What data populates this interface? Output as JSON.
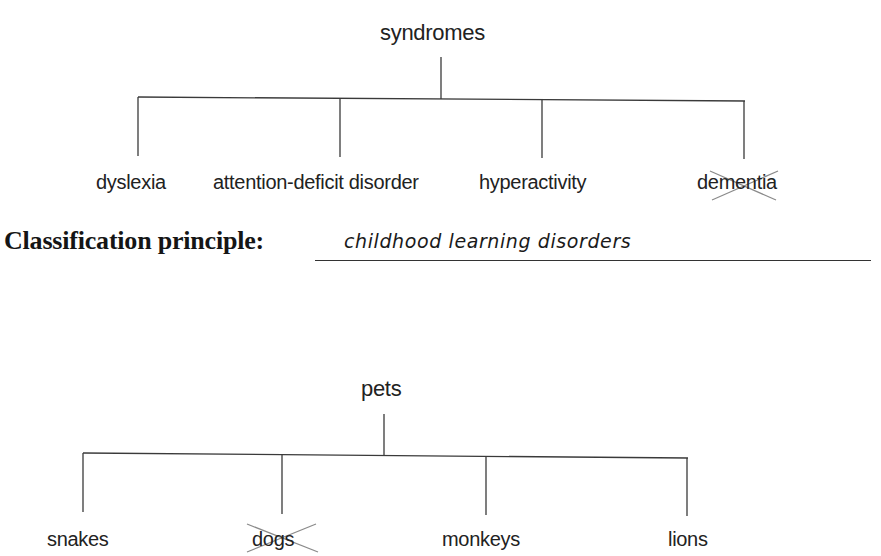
{
  "trees": [
    {
      "root": "syndromes",
      "children": [
        {
          "label": "dyslexia",
          "crossed_out": false
        },
        {
          "label": "attention-deficit disorder",
          "crossed_out": false
        },
        {
          "label": "hyperactivity",
          "crossed_out": false
        },
        {
          "label": "dementia",
          "crossed_out": true
        }
      ],
      "classification_principle": {
        "label": "Classification principle:",
        "answer": "childhood learning disorders"
      }
    },
    {
      "root": "pets",
      "children": [
        {
          "label": "snakes",
          "crossed_out": false
        },
        {
          "label": "dogs",
          "crossed_out": true
        },
        {
          "label": "monkeys",
          "crossed_out": false
        },
        {
          "label": "lions",
          "crossed_out": false
        }
      ]
    }
  ],
  "colors": {
    "line": "#3a3a3a",
    "cross_mark": "#8a8a8a",
    "text": "#222222"
  }
}
